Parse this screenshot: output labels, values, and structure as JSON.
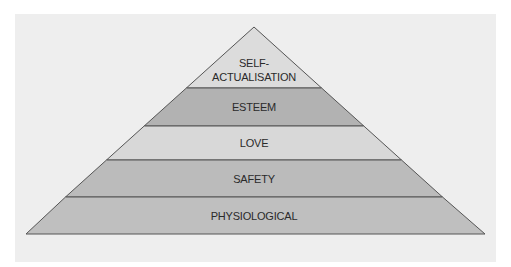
{
  "diagram": {
    "type": "pyramid",
    "title": "",
    "levels": [
      {
        "label_line1": "SELF-",
        "label_line2": "ACTUALISATION",
        "color": "#dcdcdc"
      },
      {
        "label": "ESTEEM",
        "color": "#b2b2b2"
      },
      {
        "label": "LOVE",
        "color": "#d8d8d8"
      },
      {
        "label": "SAFETY",
        "color": "#bbbbbb"
      },
      {
        "label": "PHYSIOLOGICAL",
        "color": "#bfbfbf"
      }
    ],
    "background": "#eeeeee",
    "outline_color": "#555555"
  }
}
